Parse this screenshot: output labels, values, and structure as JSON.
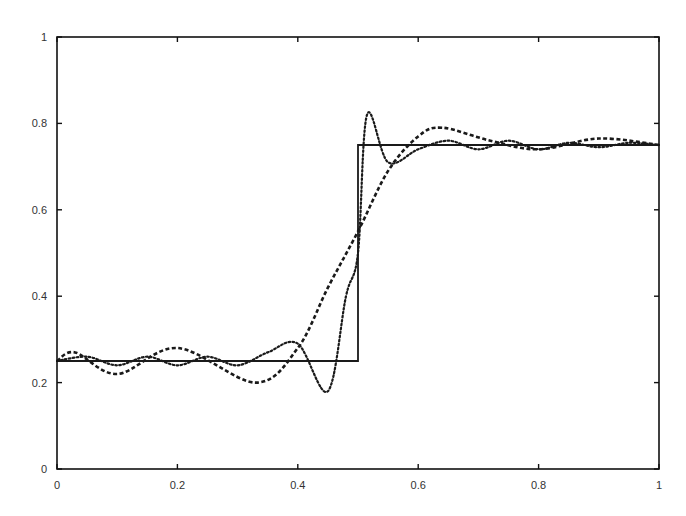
{
  "chart_data": {
    "type": "line",
    "title": "",
    "xlabel": "",
    "ylabel": "",
    "xlim": [
      0,
      1
    ],
    "ylim": [
      0,
      1
    ],
    "grid": false,
    "legend": null,
    "x_ticks": [
      "0",
      "0.2",
      "0.4",
      "0.6",
      "0.8",
      "1"
    ],
    "y_ticks": [
      "0",
      "0.2",
      "0.4",
      "0.6",
      "0.8",
      "1"
    ],
    "series": [
      {
        "name": "step function",
        "style": "solid",
        "x": [
          0,
          0.5,
          0.5,
          1
        ],
        "y": [
          0.25,
          0.25,
          0.75,
          0.75
        ]
      },
      {
        "name": "low-order approximation",
        "style": "dashed",
        "x": [
          0,
          0.03,
          0.1,
          0.2,
          0.33,
          0.4,
          0.45,
          0.5,
          0.55,
          0.6,
          0.64,
          0.72,
          0.8,
          0.9,
          1
        ],
        "y": [
          0.25,
          0.27,
          0.22,
          0.28,
          0.2,
          0.28,
          0.42,
          0.55,
          0.69,
          0.77,
          0.79,
          0.76,
          0.74,
          0.765,
          0.75
        ]
      },
      {
        "name": "high-order approximation",
        "style": "dotted",
        "x": [
          0,
          0.05,
          0.1,
          0.15,
          0.2,
          0.25,
          0.3,
          0.35,
          0.4,
          0.45,
          0.48,
          0.5,
          0.515,
          0.55,
          0.6,
          0.65,
          0.7,
          0.75,
          0.8,
          0.85,
          0.9,
          0.95,
          1
        ],
        "y": [
          0.25,
          0.26,
          0.24,
          0.26,
          0.24,
          0.26,
          0.24,
          0.27,
          0.29,
          0.18,
          0.4,
          0.5,
          0.82,
          0.71,
          0.74,
          0.76,
          0.74,
          0.76,
          0.74,
          0.755,
          0.745,
          0.755,
          0.75
        ]
      }
    ]
  }
}
